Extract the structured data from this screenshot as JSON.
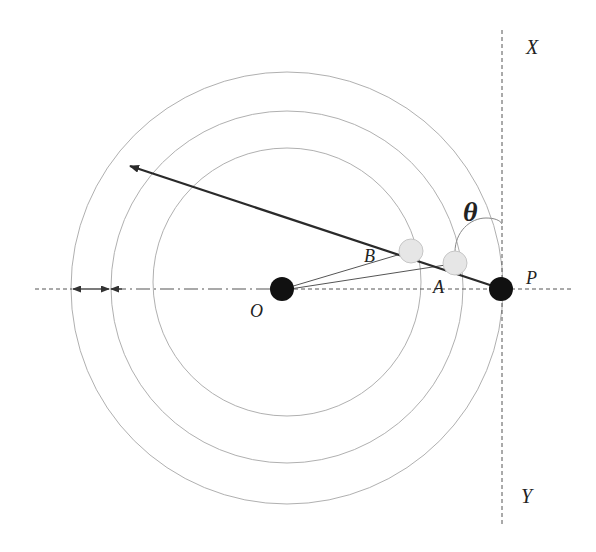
{
  "diagram": {
    "labels": {
      "X": "X",
      "Y": "Y",
      "theta": "θ",
      "B": "B",
      "A": "A",
      "P": "P",
      "O": "O"
    },
    "colors": {
      "circle_stroke": "#b0b0b0",
      "axis_stroke": "#555555",
      "solid_point": "#111111",
      "hollow_point_fill": "#e6e6e6",
      "arrow_stroke": "#2a2a2a"
    },
    "points": {
      "O": {
        "x": 282,
        "y": 289,
        "style": "solid"
      },
      "B": {
        "x": 411,
        "y": 251,
        "style": "light"
      },
      "A": {
        "x": 455,
        "y": 263,
        "style": "light"
      },
      "P": {
        "x": 501,
        "y": 289,
        "style": "solid"
      }
    },
    "circles": [
      {
        "name": "inner",
        "cx": 287,
        "cy": 282,
        "r": 134
      },
      {
        "name": "middle",
        "cx": 287,
        "cy": 287,
        "r": 176
      },
      {
        "name": "outer",
        "cx": 287,
        "cy": 288,
        "r": 218
      }
    ]
  }
}
